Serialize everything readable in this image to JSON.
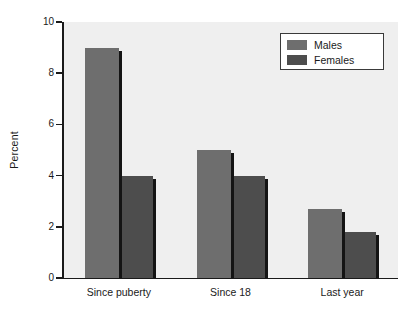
{
  "chart_data": {
    "type": "bar",
    "title": "",
    "subtitle": "",
    "xlabel": "",
    "ylabel": "Percent",
    "categories": [
      "Since puberty",
      "Since 18",
      "Last year"
    ],
    "series": [
      {
        "name": "Males",
        "color": "#6e6e6e",
        "values": [
          9.0,
          5.0,
          2.7
        ]
      },
      {
        "name": "Females",
        "color": "#4d4d4d",
        "values": [
          4.0,
          4.0,
          1.8
        ]
      }
    ],
    "ylim": [
      0,
      10
    ],
    "yticks": [
      0,
      2,
      4,
      6,
      8,
      10
    ],
    "ytick_labels": [
      "0",
      "2",
      "4",
      "6",
      "8",
      "10"
    ],
    "grid": false,
    "legend_position": "top-right",
    "legend_entries": [
      "Males",
      "Females"
    ],
    "plot_background": "#efefef",
    "figure_background": "#ffffff",
    "axis_color": "#1a1a1a"
  }
}
